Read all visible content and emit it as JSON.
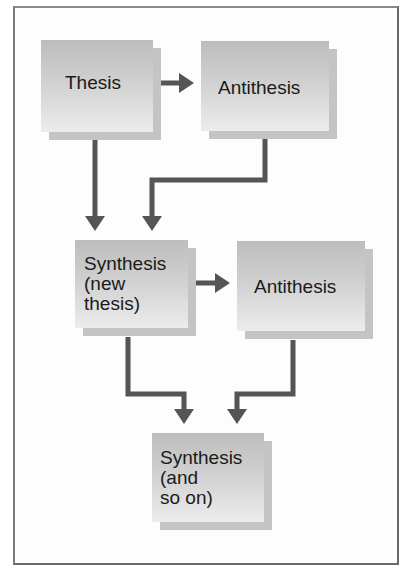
{
  "diagram": {
    "title": "",
    "nodes": [
      {
        "id": "thesis",
        "label": "Thesis"
      },
      {
        "id": "antithesis_1",
        "label": "Antithesis"
      },
      {
        "id": "synthesis_1",
        "label": "Synthesis\n(new\nthesis)"
      },
      {
        "id": "antithesis_2",
        "label": "Antithesis"
      },
      {
        "id": "synthesis_2",
        "label": "Synthesis\n(and\nso on)"
      }
    ],
    "edges": [
      {
        "from": "thesis",
        "to": "antithesis_1"
      },
      {
        "from": "thesis",
        "to": "synthesis_1"
      },
      {
        "from": "antithesis_1",
        "to": "synthesis_1"
      },
      {
        "from": "synthesis_1",
        "to": "antithesis_2"
      },
      {
        "from": "synthesis_1",
        "to": "synthesis_2"
      },
      {
        "from": "antithesis_2",
        "to": "synthesis_2"
      }
    ],
    "colors": {
      "box": "#cfcfcf",
      "box_shadow": "#c4c4c4",
      "arrow": "#555555",
      "frame": "#6a6a6a",
      "text": "#1a1a1a"
    }
  }
}
